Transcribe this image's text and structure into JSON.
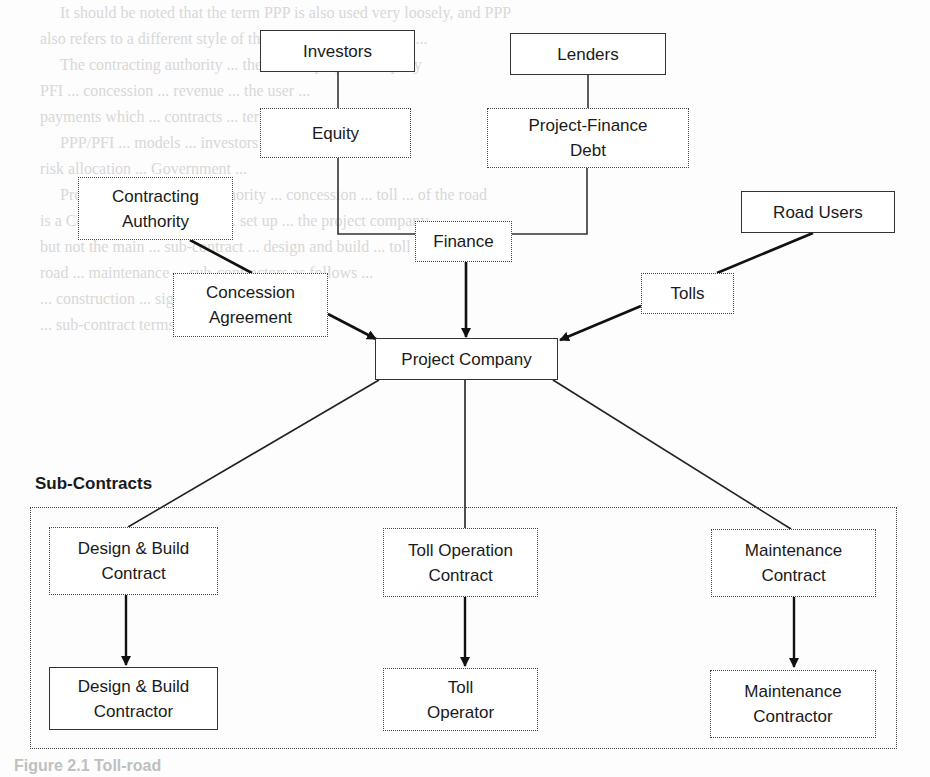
{
  "diagram": {
    "nodes": {
      "investors": "Investors",
      "lenders": "Lenders",
      "equity": "Equity",
      "project_finance_debt": "Project-Finance Debt",
      "contracting_authority": "Contracting Authority",
      "finance": "Finance",
      "road_users": "Road Users",
      "concession_agreement": "Concession Agreement",
      "tolls": "Tolls",
      "project_company": "Project Company",
      "design_build_contract": "Design & Build Contract",
      "toll_operation_contract": "Toll Operation Contract",
      "maintenance_contract": "Maintenance Contract",
      "design_build_contractor": "Design & Build Contractor",
      "toll_operator": "Toll Operator",
      "maintenance_contractor": "Maintenance Contractor"
    },
    "group_label": "Sub-Contracts",
    "caption": "Figure 2.1 Toll-road",
    "edges": [
      {
        "from": "Investors",
        "to": "Equity",
        "arrow": false
      },
      {
        "from": "Equity",
        "to": "Finance",
        "arrow": false
      },
      {
        "from": "Lenders",
        "to": "Project-Finance Debt",
        "arrow": false
      },
      {
        "from": "Project-Finance Debt",
        "to": "Finance",
        "arrow": false
      },
      {
        "from": "Finance",
        "to": "Project Company",
        "arrow": true
      },
      {
        "from": "Contracting Authority",
        "to": "Concession Agreement",
        "arrow": false
      },
      {
        "from": "Concession Agreement",
        "to": "Project Company",
        "arrow": true
      },
      {
        "from": "Road Users",
        "to": "Tolls",
        "arrow": false
      },
      {
        "from": "Tolls",
        "to": "Project Company",
        "arrow": true
      },
      {
        "from": "Project Company",
        "to": "Design & Build Contract",
        "arrow": false
      },
      {
        "from": "Project Company",
        "to": "Toll Operation Contract",
        "arrow": false
      },
      {
        "from": "Project Company",
        "to": "Maintenance Contract",
        "arrow": false
      },
      {
        "from": "Design & Build Contract",
        "to": "Design & Build Contractor",
        "arrow": true
      },
      {
        "from": "Toll Operation Contract",
        "to": "Toll Operator",
        "arrow": true
      },
      {
        "from": "Maintenance Contract",
        "to": "Maintenance Contractor",
        "arrow": true
      }
    ]
  },
  "background_text": "     It should be noted that the term PPP is also used very loosely, and PPP\nalso refers to a different style of the Private Finance model...\n     The contracting authority ... the road ... project company\nPFI ... concession ... revenue ... the user ...\npayments which ... contracts ... terms ...\n     PPP/PFI ... models ... investors ... lenders\nrisk allocation ... Government ...\n     Project ... Contracting Authority ... concession ... toll ... of the road\nis a Contracting ... company ... set up ... the project company ...\nbut not the main ... sub-contract ... design and build ... toll ...\nroad ... maintenance ... sub-contractors as follows ...\n... construction ... signed with ...\n... sub-contract terms ... contractors ...\n\n\n\n\n\n\n"
}
